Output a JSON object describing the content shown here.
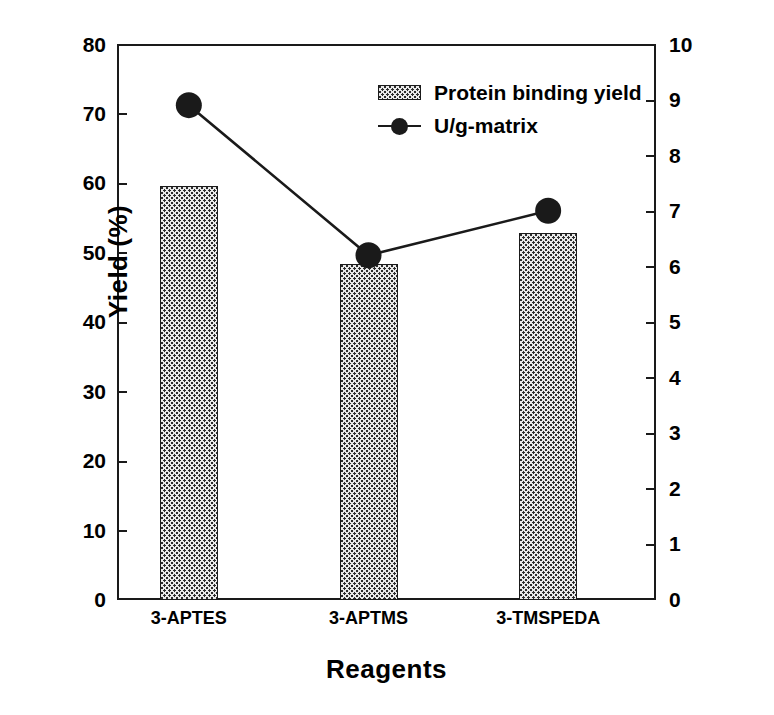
{
  "chart_data": {
    "type": "bar",
    "title": "",
    "xlabel": "Reagents",
    "ylabel": "Yield (%)",
    "ylabel_right": "Activity( U/g-matrix )",
    "categories": [
      "3-APTES",
      "3-APTMS",
      "3-TMSPEDA"
    ],
    "ylim": [
      0,
      80
    ],
    "ylim_right": [
      0,
      10
    ],
    "yticks": [
      0,
      10,
      20,
      30,
      40,
      50,
      60,
      70,
      80
    ],
    "yticks_right": [
      0,
      1,
      2,
      3,
      4,
      5,
      6,
      7,
      8,
      9,
      10
    ],
    "grid": false,
    "legend_position": "upper-center-right",
    "series": [
      {
        "name": "Protein binding yield",
        "type": "bar",
        "axis": "left",
        "unit": "%",
        "values": [
          59.5,
          48.3,
          52.8
        ]
      },
      {
        "name": "U/g-matrix",
        "type": "line",
        "axis": "right",
        "unit": "U/g-matrix",
        "marker": "filled-circle",
        "values": [
          8.9,
          6.2,
          7.0
        ]
      }
    ]
  },
  "legend": {
    "items": [
      {
        "label": "Protein binding yield",
        "swatch": "hatched-square"
      },
      {
        "label": "U/g-matrix",
        "swatch": "line-circle-marker"
      }
    ]
  },
  "colors": {
    "axis": "#1a1a1a",
    "bar_fill": "#e9e9e9",
    "bar_pattern": "#2b2b2b",
    "marker": "#1a1a1a",
    "background": "#ffffff"
  }
}
